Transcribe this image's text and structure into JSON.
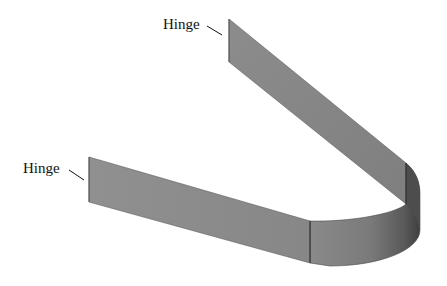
{
  "figure": {
    "labels": {
      "top_hinge": "Hinge",
      "left_hinge": "Hinge"
    },
    "colors": {
      "strip_face": "#8f8f8f",
      "strip_face_dark": "#6e6e6e",
      "curve_shadow": "#4a4a4a",
      "edge_line": "#2b2b2b",
      "background": "#ffffff",
      "text": "#111111"
    }
  }
}
